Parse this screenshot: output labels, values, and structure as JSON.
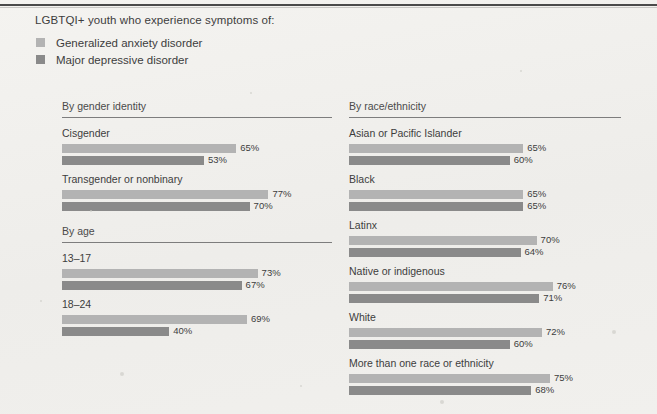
{
  "title": "LGBTQI+ youth who experience symptoms of:",
  "legend": [
    {
      "label": "Generalized anxiety disorder",
      "color": "#b3b3b3",
      "key": "anxiety"
    },
    {
      "label": "Major depressive disorder",
      "color": "#8a8a8a",
      "key": "depression"
    }
  ],
  "colors": {
    "anxiety": "#b3b3b3",
    "depression": "#8a8a8a",
    "rule": "#7d7d7d",
    "text": "#3d3d3d",
    "background": "#f1f0ed"
  },
  "columns": {
    "left": [
      {
        "heading": "By gender identity",
        "groups": [
          {
            "label": "Cisgender",
            "bars": [
              {
                "series": "Generalized anxiety disorder",
                "value": 65,
                "value_label": "65%"
              },
              {
                "series": "Major depressive disorder",
                "value": 53,
                "value_label": "53%"
              }
            ]
          },
          {
            "label": "Transgender or nonbinary",
            "bars": [
              {
                "series": "Generalized anxiety disorder",
                "value": 77,
                "value_label": "77%"
              },
              {
                "series": "Major depressive disorder",
                "value": 70,
                "value_label": "70%"
              }
            ]
          }
        ]
      },
      {
        "heading": "By age",
        "groups": [
          {
            "label": "13–17",
            "bars": [
              {
                "series": "Generalized anxiety disorder",
                "value": 73,
                "value_label": "73%"
              },
              {
                "series": "Major depressive disorder",
                "value": 67,
                "value_label": "67%"
              }
            ]
          },
          {
            "label": "18–24",
            "bars": [
              {
                "series": "Generalized anxiety disorder",
                "value": 69,
                "value_label": "69%"
              },
              {
                "series": "Major depressive disorder",
                "value": 40,
                "value_label": "40%"
              }
            ]
          }
        ]
      }
    ],
    "right": [
      {
        "heading": "By race/ethnicity",
        "groups": [
          {
            "label": "Asian or Pacific Islander",
            "bars": [
              {
                "series": "Generalized anxiety disorder",
                "value": 65,
                "value_label": "65%"
              },
              {
                "series": "Major depressive disorder",
                "value": 60,
                "value_label": "60%"
              }
            ]
          },
          {
            "label": "Black",
            "bars": [
              {
                "series": "Generalized anxiety disorder",
                "value": 65,
                "value_label": "65%"
              },
              {
                "series": "Major depressive disorder",
                "value": 65,
                "value_label": "65%"
              }
            ]
          },
          {
            "label": "Latinx",
            "bars": [
              {
                "series": "Generalized anxiety disorder",
                "value": 70,
                "value_label": "70%"
              },
              {
                "series": "Major depressive disorder",
                "value": 64,
                "value_label": "64%"
              }
            ]
          },
          {
            "label": "Native or indigenous",
            "bars": [
              {
                "series": "Generalized anxiety disorder",
                "value": 76,
                "value_label": "76%"
              },
              {
                "series": "Major depressive disorder",
                "value": 71,
                "value_label": "71%"
              }
            ]
          },
          {
            "label": "White",
            "bars": [
              {
                "series": "Generalized anxiety disorder",
                "value": 72,
                "value_label": "72%"
              },
              {
                "series": "Major depressive disorder",
                "value": 60,
                "value_label": "60%"
              }
            ]
          },
          {
            "label": "More than one race or ethnicity",
            "bars": [
              {
                "series": "Generalized anxiety disorder",
                "value": 75,
                "value_label": "75%"
              },
              {
                "series": "Major depressive disorder",
                "value": 68,
                "value_label": "68%"
              }
            ]
          }
        ]
      }
    ]
  },
  "chart_data": {
    "type": "bar",
    "title": "LGBTQI+ youth who experience symptoms of:",
    "xlabel": "",
    "ylabel": "",
    "xlim": [
      0,
      100
    ],
    "grid": false,
    "legend_position": "top-left",
    "orientation": "horizontal",
    "unit": "percent",
    "series": [
      {
        "name": "Generalized anxiety disorder",
        "color": "#b3b3b3",
        "values": [
          65,
          77,
          73,
          69,
          65,
          65,
          70,
          76,
          72,
          75
        ]
      },
      {
        "name": "Major depressive disorder",
        "color": "#8a8a8a",
        "values": [
          53,
          70,
          67,
          40,
          60,
          65,
          64,
          71,
          60,
          68
        ]
      }
    ],
    "categories": [
      "Cisgender",
      "Transgender or nonbinary",
      "13–17",
      "18–24",
      "Asian or Pacific Islander",
      "Black",
      "Latinx",
      "Native or indigenous",
      "White",
      "More than one race or ethnicity"
    ],
    "category_sections": [
      {
        "heading": "By gender identity",
        "categories": [
          "Cisgender",
          "Transgender or nonbinary"
        ]
      },
      {
        "heading": "By age",
        "categories": [
          "13–17",
          "18–24"
        ]
      },
      {
        "heading": "By race/ethnicity",
        "categories": [
          "Asian or Pacific Islander",
          "Black",
          "Latinx",
          "Native or indigenous",
          "White",
          "More than one race or ethnicity"
        ]
      }
    ]
  },
  "scale": {
    "px_per_percent": 2.68
  }
}
